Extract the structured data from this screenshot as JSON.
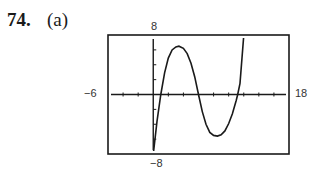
{
  "problem": {
    "number": "74.",
    "part": "(a)"
  },
  "window": {
    "xmin_label": "−6",
    "xmax_label": "18",
    "ymin_label": "−8",
    "ymax_label": "8"
  },
  "chart_data": {
    "type": "line",
    "title": "",
    "xlabel": "",
    "ylabel": "",
    "xlim": [
      -6,
      18
    ],
    "ylim": [
      -8,
      8
    ],
    "xscale_tick": 2,
    "yscale_tick": 2,
    "grid": false,
    "legend": null,
    "frame": {
      "left": 108,
      "top": 35,
      "right": 289,
      "bottom": 154
    },
    "series": [
      {
        "name": "f(x)",
        "description": "cubic-like curve with zeros near x≈1, x≈6, x≈11.2; local max ≈(3.4, 6.5); local min ≈(9, -5.6)",
        "x": [
          0,
          0.5,
          1,
          1.5,
          2,
          2.5,
          3,
          3.4,
          4,
          4.5,
          5,
          5.5,
          6,
          6.5,
          7,
          7.5,
          8,
          8.5,
          9,
          9.5,
          10,
          10.5,
          11,
          11.2,
          11.5,
          12
        ],
        "y": [
          -8,
          -3.6,
          0,
          2.9,
          4.9,
          6.0,
          6.4,
          6.5,
          6.2,
          5.5,
          4.2,
          2.4,
          0,
          -2.3,
          -4.0,
          -5.1,
          -5.5,
          -5.6,
          -5.4,
          -4.9,
          -3.9,
          -2.6,
          -0.8,
          0,
          1.5,
          8
        ]
      }
    ],
    "extrema": {
      "local_max": [
        3.4,
        6.5
      ],
      "local_min": [
        9,
        -5.6
      ]
    },
    "zeros": [
      1,
      6,
      11.2
    ]
  }
}
